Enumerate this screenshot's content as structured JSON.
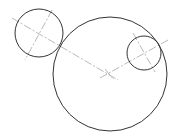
{
  "diagram": {
    "colors": {
      "circle_stroke": "#333333",
      "centerline_stroke": "#888888",
      "background": "#ffffff"
    },
    "circles": [
      {
        "id": "small-left",
        "cx": 39,
        "cy": 33,
        "r": 24
      },
      {
        "id": "large-center",
        "cx": 110,
        "cy": 74,
        "r": 57
      },
      {
        "id": "small-right",
        "cx": 144,
        "cy": 53,
        "r": 17
      }
    ],
    "centerlines": [
      {
        "id": "left-to-center",
        "x1": 12,
        "y1": 18,
        "x2": 118,
        "y2": 80
      },
      {
        "id": "left-perpendicular",
        "x1": 52,
        "y1": 10,
        "x2": 25,
        "y2": 60
      },
      {
        "id": "center-to-right",
        "x1": 100,
        "y1": 78,
        "x2": 168,
        "y2": 40
      },
      {
        "id": "right-perpendicular",
        "x1": 133,
        "y1": 33,
        "x2": 155,
        "y2": 72
      },
      {
        "id": "center-tick",
        "x1": 105,
        "y1": 69,
        "x2": 114,
        "y2": 80
      }
    ]
  }
}
